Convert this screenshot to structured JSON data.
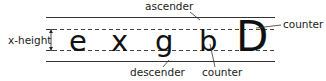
{
  "diagram": {
    "glyphs": [
      "e",
      "x",
      "g",
      "b",
      "D"
    ],
    "labels": {
      "x_height": "x-height",
      "ascender": "ascender",
      "descender": "descender",
      "counter_b": "counter",
      "counter_D": "counter"
    },
    "guidelines": [
      "ascender line",
      "x-height line",
      "baseline",
      "descender line"
    ]
  }
}
